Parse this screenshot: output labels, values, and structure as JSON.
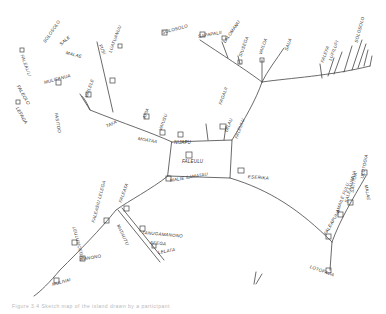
{
  "map": {
    "type": "hand-drawn sketch map",
    "background": "#ffffff",
    "ink_color": "#333333",
    "center_block": {
      "label_top": "NIJAFU",
      "label_inner": "FALEULU"
    },
    "labels": [
      {
        "id": "nw1",
        "text": "SOLOSOLO",
        "x": 44,
        "y": 40,
        "rot": -55
      },
      {
        "id": "nw2",
        "text": "SALE",
        "x": 60,
        "y": 42,
        "rot": -40
      },
      {
        "id": "nw3",
        "text": "MALAE",
        "x": 66,
        "y": 50,
        "rot": 15
      },
      {
        "id": "w1",
        "text": "FALEALILI",
        "x": 22,
        "y": 52,
        "rot": 70
      },
      {
        "id": "w2",
        "text": "FALEOLO",
        "x": 18,
        "y": 83,
        "rot": 60
      },
      {
        "id": "w3",
        "text": "LEFAGA",
        "x": 17,
        "y": 105,
        "rot": 60
      },
      {
        "id": "w4",
        "text": "MULIFANUA",
        "x": 44,
        "y": 80,
        "rot": -15
      },
      {
        "id": "w5",
        "text": "FASITOO",
        "x": 56,
        "y": 110,
        "rot": 80
      },
      {
        "id": "n1",
        "text": "FUSI",
        "x": 100,
        "y": 42,
        "rot": 65
      },
      {
        "id": "n2",
        "text": "LUATUANUU",
        "x": 110,
        "y": 50,
        "rot": -70
      },
      {
        "id": "n3",
        "text": "VAILELE",
        "x": 86,
        "y": 95,
        "rot": -70
      },
      {
        "id": "n4",
        "text": "SOLOSOLO",
        "x": 162,
        "y": 30,
        "rot": -15
      },
      {
        "id": "c1",
        "text": "TAFA",
        "x": 106,
        "y": 124,
        "rot": -25
      },
      {
        "id": "c2",
        "text": "MOATAA",
        "x": 138,
        "y": 136,
        "rot": 10
      },
      {
        "id": "c3",
        "text": "APIA",
        "x": 144,
        "y": 116,
        "rot": -70
      },
      {
        "id": "c4",
        "text": "VAIUSU",
        "x": 160,
        "y": 128,
        "rot": -70
      },
      {
        "id": "ne1",
        "text": "SAPAPALII",
        "x": 198,
        "y": 34,
        "rot": -10
      },
      {
        "id": "ne2",
        "text": "LALOMANU",
        "x": 224,
        "y": 40,
        "rot": -55
      },
      {
        "id": "ne3",
        "text": "SIUSEGA",
        "x": 240,
        "y": 54,
        "rot": -70
      },
      {
        "id": "ne4",
        "text": "VAILOA",
        "x": 260,
        "y": 52,
        "rot": -70
      },
      {
        "id": "ne5",
        "text": "SAUA",
        "x": 286,
        "y": 48,
        "rot": -70
      },
      {
        "id": "ne6",
        "text": "FAGALII",
        "x": 220,
        "y": 102,
        "rot": -70
      },
      {
        "id": "ne7",
        "text": "TALAU",
        "x": 226,
        "y": 130,
        "rot": -70
      },
      {
        "id": "ne8",
        "text": "FALEULU",
        "x": 236,
        "y": 136,
        "rot": -70
      },
      {
        "id": "e1",
        "text": "FALEFA",
        "x": 322,
        "y": 60,
        "rot": -70
      },
      {
        "id": "e2",
        "text": "LUFILUFI",
        "x": 330,
        "y": 58,
        "rot": -70
      },
      {
        "id": "e3",
        "text": "SOLOSOLO",
        "x": 356,
        "y": 40,
        "rot": -75
      },
      {
        "id": "se0",
        "text": "ESERIKA",
        "x": 248,
        "y": 174,
        "rot": 5
      },
      {
        "id": "se1",
        "text": "FALEAPUNA",
        "x": 325,
        "y": 232,
        "rot": -60
      },
      {
        "id": "se2",
        "text": "AMAILE FULU",
        "x": 337,
        "y": 210,
        "rot": -70
      },
      {
        "id": "se3",
        "text": "SALEAAUMUA",
        "x": 346,
        "y": 200,
        "rot": -75
      },
      {
        "id": "se4",
        "text": "SATITOA",
        "x": 352,
        "y": 190,
        "rot": -80
      },
      {
        "id": "se5",
        "text": "ULUTOGIA",
        "x": 362,
        "y": 176,
        "rot": -80
      },
      {
        "id": "se6",
        "text": "MALAE",
        "x": 366,
        "y": 182,
        "rot": 80
      },
      {
        "id": "se7",
        "text": "LOTOFAGA",
        "x": 310,
        "y": 264,
        "rot": 20
      },
      {
        "id": "s0",
        "text": "MALIE SAMATAU",
        "x": 170,
        "y": 178,
        "rot": -10
      },
      {
        "id": "s1",
        "text": "FALEATA",
        "x": 120,
        "y": 200,
        "rot": -70
      },
      {
        "id": "s2",
        "text": "FALEASIU LELEGA",
        "x": 93,
        "y": 220,
        "rot": -75
      },
      {
        "id": "s3",
        "text": "MATAUTU",
        "x": 118,
        "y": 222,
        "rot": 65
      },
      {
        "id": "s4",
        "text": "TANUGAMANONO",
        "x": 142,
        "y": 230,
        "rot": 5
      },
      {
        "id": "s5",
        "text": "AFEGA",
        "x": 150,
        "y": 240,
        "rot": 5
      },
      {
        "id": "s6",
        "text": "LELATA",
        "x": 158,
        "y": 250,
        "rot": -10
      },
      {
        "id": "sw1",
        "text": "LEULUMOEGA",
        "x": 74,
        "y": 224,
        "rot": 75
      },
      {
        "id": "sw2",
        "text": "MANONO",
        "x": 80,
        "y": 257,
        "rot": -10
      },
      {
        "id": "sw3",
        "text": "MULIVAI",
        "x": 52,
        "y": 282,
        "rot": -15
      }
    ]
  },
  "caption": "Figure 3.4 Sketch map of the island drawn by a participant"
}
